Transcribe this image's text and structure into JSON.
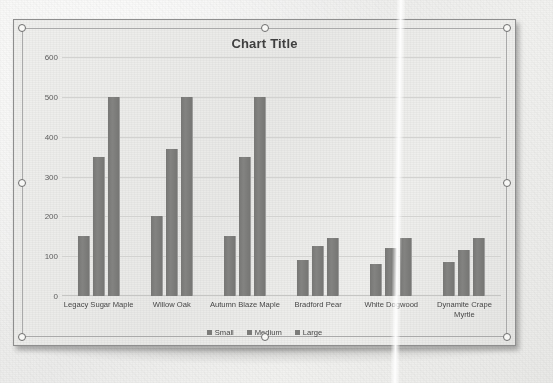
{
  "document": {
    "object_type": "chart-object",
    "selected": true,
    "handle_names": [
      "top-left",
      "top-center",
      "top-right",
      "middle-left",
      "middle-right",
      "bottom-left",
      "bottom-center",
      "bottom-right"
    ]
  },
  "colors": {
    "bar": "#7b7b79",
    "gridline": "#d2d2d0",
    "text": "#464646",
    "title": "#3f3f3f",
    "object_border": "#8e8e8e",
    "handle_fill": "#f7f7f5",
    "handle_stroke": "#6d6d6d",
    "plot_background": "#ececea"
  },
  "chart_data": {
    "type": "bar",
    "title": "Chart Title",
    "xlabel": "",
    "ylabel": "",
    "ylim": [
      0,
      600
    ],
    "yticks": [
      0,
      100,
      200,
      300,
      400,
      500,
      600
    ],
    "ytick_labels": [
      "0",
      "100",
      "200",
      "300",
      "400",
      "500",
      "600"
    ],
    "grid": true,
    "grid_axis": "y",
    "legend_position": "bottom",
    "categories": [
      "Legacy Sugar Maple",
      "Willow Oak",
      "Autumn Blaze Maple",
      "Bradford Pear",
      "White Dogwood",
      "Dynamite Crape Myrtle"
    ],
    "series": [
      {
        "name": "Small",
        "values": [
          150,
          200,
          150,
          90,
          80,
          85
        ]
      },
      {
        "name": "Medium",
        "values": [
          350,
          370,
          350,
          125,
          120,
          115
        ]
      },
      {
        "name": "Large",
        "values": [
          500,
          500,
          500,
          145,
          145,
          145
        ]
      }
    ]
  }
}
